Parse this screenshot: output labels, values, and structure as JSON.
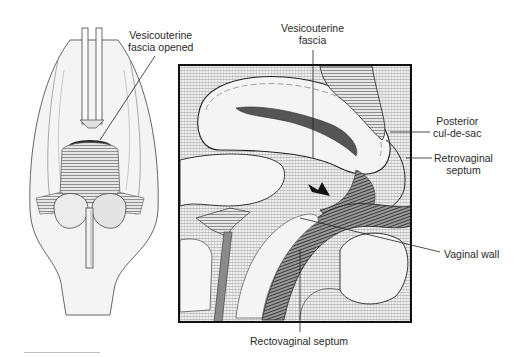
{
  "figure": {
    "left_panel": {
      "description": "Surgical view through vaginal opening with retractors",
      "labels": {
        "vesicouterine_fascia_opened": {
          "line1": "Vesicouterine",
          "line2": "fascia opened"
        }
      }
    },
    "right_panel": {
      "description": "Sagittal cross-section of pelvic anatomy",
      "labels": {
        "vesicouterine_fascia": {
          "line1": "Vesicouterine",
          "line2": "fascia"
        },
        "posterior_cul_de_sac": {
          "line1": "Posterior",
          "line2": "cul-de-sac"
        },
        "retrovaginal_septum": {
          "line1": "Retrovaginal",
          "line2": "septum"
        },
        "vaginal_wall": {
          "line1": "Vaginal wall"
        },
        "rectovaginal_septum": {
          "line1": "Rectovaginal septum"
        }
      }
    },
    "colors": {
      "ink": "#1a1a1a",
      "tissue": "#ececec",
      "shade": "#8a8a8a",
      "dark": "#3a3a3a",
      "frame": "#111111"
    }
  }
}
